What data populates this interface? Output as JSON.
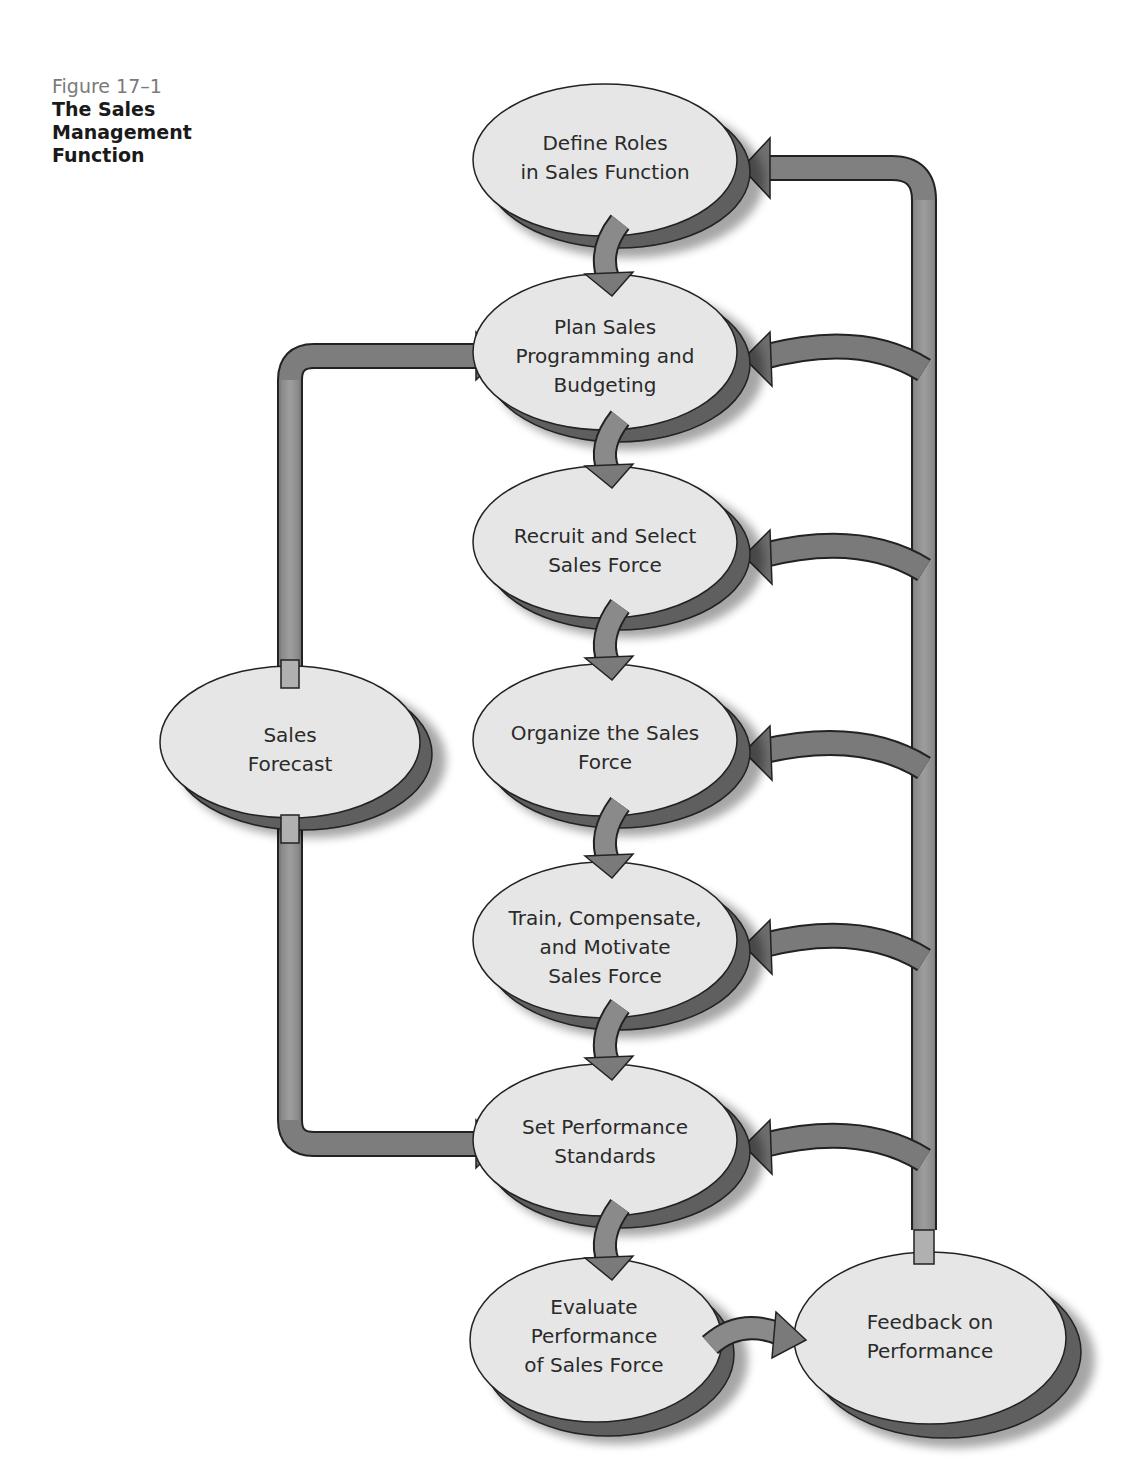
{
  "page_header_fragment": "Chapter 17 Sales Management",
  "caption": {
    "figure_number": "Figure 17–1",
    "title": "The Sales Management Function"
  },
  "colors": {
    "node_fill": "#e6e6e6",
    "node_shadow": "#6e6e6e",
    "arrow_fill": "#7d7d7d",
    "arrow_light": "#a9a9a9",
    "outline": "#222222"
  },
  "nodes": [
    {
      "id": "define-roles",
      "lines": [
        "Define Roles",
        "in Sales Function"
      ]
    },
    {
      "id": "plan-sales",
      "lines": [
        "Plan Sales",
        "Programming and",
        "Budgeting"
      ]
    },
    {
      "id": "recruit-select",
      "lines": [
        "Recruit and Select",
        "Sales Force"
      ]
    },
    {
      "id": "organize",
      "lines": [
        "Organize the Sales",
        "Force"
      ]
    },
    {
      "id": "train-compensate",
      "lines": [
        "Train, Compensate,",
        "and Motivate",
        "Sales Force"
      ]
    },
    {
      "id": "set-standards",
      "lines": [
        "Set Performance",
        "Standards"
      ]
    },
    {
      "id": "evaluate",
      "lines": [
        "Evaluate",
        "Performance",
        "of Sales Force"
      ]
    },
    {
      "id": "feedback",
      "lines": [
        "Feedback on",
        "Performance"
      ]
    },
    {
      "id": "sales-forecast",
      "lines": [
        "Sales",
        "Forecast"
      ]
    }
  ],
  "edges": [
    {
      "from": "define-roles",
      "to": "plan-sales"
    },
    {
      "from": "plan-sales",
      "to": "recruit-select"
    },
    {
      "from": "recruit-select",
      "to": "organize"
    },
    {
      "from": "organize",
      "to": "train-compensate"
    },
    {
      "from": "train-compensate",
      "to": "set-standards"
    },
    {
      "from": "set-standards",
      "to": "evaluate"
    },
    {
      "from": "evaluate",
      "to": "feedback"
    },
    {
      "from": "sales-forecast",
      "to": "plan-sales"
    },
    {
      "from": "sales-forecast",
      "to": "set-standards"
    },
    {
      "from": "feedback",
      "to": "define-roles"
    },
    {
      "from": "feedback",
      "to": "plan-sales"
    },
    {
      "from": "feedback",
      "to": "recruit-select"
    },
    {
      "from": "feedback",
      "to": "organize"
    },
    {
      "from": "feedback",
      "to": "train-compensate"
    },
    {
      "from": "feedback",
      "to": "set-standards"
    }
  ]
}
